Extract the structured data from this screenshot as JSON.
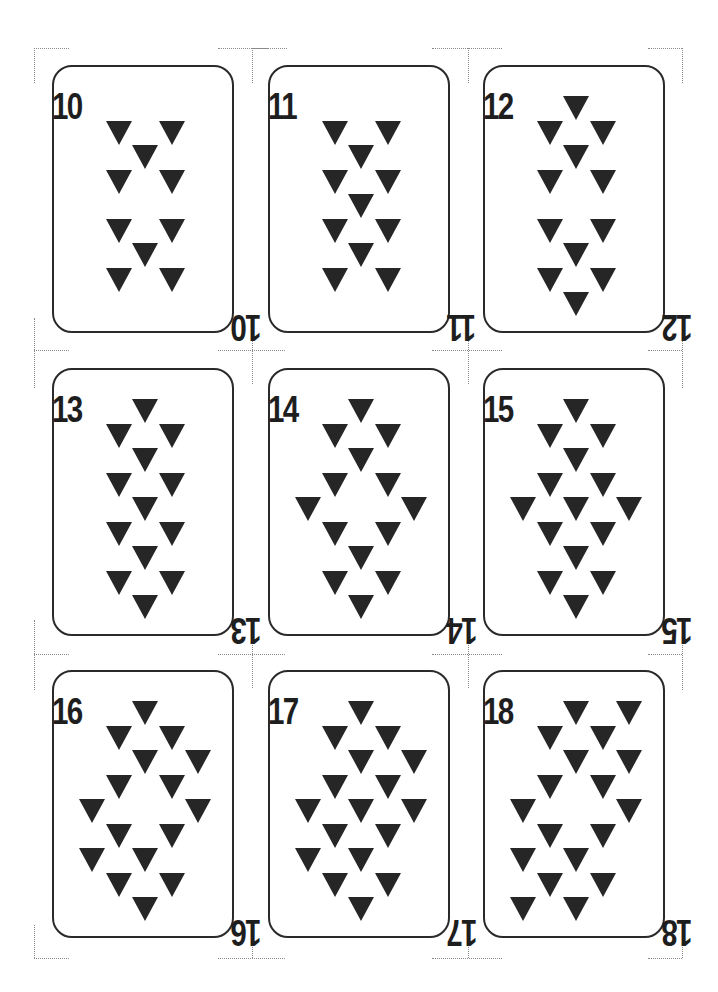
{
  "sheet": {
    "description": "Printable sheet of 9 playing cards (3x3) with inverted-triangle pips, ranks 10 through 18",
    "pip_shape": "inverted-triangle",
    "colors": {
      "ink": "#262626",
      "border": "#2a2a2a",
      "crop_marks": "#8a8a8a",
      "background": "#ffffff"
    }
  },
  "layout": {
    "columns_x": [
      52,
      268,
      483
    ],
    "rows_y": [
      65,
      368,
      670
    ],
    "pip_center_x": 91,
    "pip_step_x": 26.5,
    "pip_base_y": 41,
    "pip_step_y": 24.5
  },
  "cards": [
    {
      "rank": "10",
      "row": 0,
      "col": 0,
      "pips": [
        [
          -1,
          1
        ],
        [
          1,
          1
        ],
        [
          0,
          2
        ],
        [
          -1,
          3
        ],
        [
          1,
          3
        ],
        [
          -1,
          5
        ],
        [
          1,
          5
        ],
        [
          0,
          6
        ],
        [
          -1,
          7
        ],
        [
          1,
          7
        ]
      ]
    },
    {
      "rank": "11",
      "row": 0,
      "col": 1,
      "pips": [
        [
          -1,
          1
        ],
        [
          1,
          1
        ],
        [
          0,
          2
        ],
        [
          -1,
          3
        ],
        [
          1,
          3
        ],
        [
          0,
          4
        ],
        [
          -1,
          5
        ],
        [
          1,
          5
        ],
        [
          0,
          6
        ],
        [
          -1,
          7
        ],
        [
          1,
          7
        ]
      ]
    },
    {
      "rank": "12",
      "row": 0,
      "col": 2,
      "pips": [
        [
          0,
          0
        ],
        [
          -1,
          1
        ],
        [
          1,
          1
        ],
        [
          0,
          2
        ],
        [
          -1,
          3
        ],
        [
          1,
          3
        ],
        [
          -1,
          5
        ],
        [
          1,
          5
        ],
        [
          0,
          6
        ],
        [
          -1,
          7
        ],
        [
          1,
          7
        ],
        [
          0,
          8
        ]
      ]
    },
    {
      "rank": "13",
      "row": 1,
      "col": 0,
      "pips": [
        [
          0,
          0
        ],
        [
          -1,
          1
        ],
        [
          1,
          1
        ],
        [
          0,
          2
        ],
        [
          -1,
          3
        ],
        [
          1,
          3
        ],
        [
          0,
          4
        ],
        [
          -1,
          5
        ],
        [
          1,
          5
        ],
        [
          0,
          6
        ],
        [
          -1,
          7
        ],
        [
          1,
          7
        ],
        [
          0,
          8
        ]
      ]
    },
    {
      "rank": "14",
      "row": 1,
      "col": 1,
      "pips": [
        [
          0,
          0
        ],
        [
          -1,
          1
        ],
        [
          1,
          1
        ],
        [
          0,
          2
        ],
        [
          -1,
          3
        ],
        [
          1,
          3
        ],
        [
          -2,
          4
        ],
        [
          2,
          4
        ],
        [
          -1,
          5
        ],
        [
          1,
          5
        ],
        [
          0,
          6
        ],
        [
          -1,
          7
        ],
        [
          1,
          7
        ],
        [
          0,
          8
        ]
      ]
    },
    {
      "rank": "15",
      "row": 1,
      "col": 2,
      "pips": [
        [
          0,
          0
        ],
        [
          -1,
          1
        ],
        [
          1,
          1
        ],
        [
          0,
          2
        ],
        [
          -1,
          3
        ],
        [
          1,
          3
        ],
        [
          -2,
          4
        ],
        [
          0,
          4
        ],
        [
          2,
          4
        ],
        [
          -1,
          5
        ],
        [
          1,
          5
        ],
        [
          0,
          6
        ],
        [
          -1,
          7
        ],
        [
          1,
          7
        ],
        [
          0,
          8
        ]
      ]
    },
    {
      "rank": "16",
      "row": 2,
      "col": 0,
      "pips": [
        [
          0,
          0
        ],
        [
          -1,
          1
        ],
        [
          1,
          1
        ],
        [
          0,
          2
        ],
        [
          2,
          2
        ],
        [
          -1,
          3
        ],
        [
          1,
          3
        ],
        [
          -2,
          4
        ],
        [
          2,
          4
        ],
        [
          -1,
          5
        ],
        [
          1,
          5
        ],
        [
          -2,
          6
        ],
        [
          0,
          6
        ],
        [
          -1,
          7
        ],
        [
          1,
          7
        ],
        [
          0,
          8
        ]
      ]
    },
    {
      "rank": "17",
      "row": 2,
      "col": 1,
      "pips": [
        [
          0,
          0
        ],
        [
          -1,
          1
        ],
        [
          1,
          1
        ],
        [
          0,
          2
        ],
        [
          2,
          2
        ],
        [
          -1,
          3
        ],
        [
          1,
          3
        ],
        [
          -2,
          4
        ],
        [
          0,
          4
        ],
        [
          2,
          4
        ],
        [
          -1,
          5
        ],
        [
          1,
          5
        ],
        [
          -2,
          6
        ],
        [
          0,
          6
        ],
        [
          -1,
          7
        ],
        [
          1,
          7
        ],
        [
          0,
          8
        ]
      ]
    },
    {
      "rank": "18",
      "row": 2,
      "col": 2,
      "pips": [
        [
          0,
          0
        ],
        [
          2,
          0
        ],
        [
          -1,
          1
        ],
        [
          1,
          1
        ],
        [
          0,
          2
        ],
        [
          2,
          2
        ],
        [
          -1,
          3
        ],
        [
          1,
          3
        ],
        [
          -2,
          4
        ],
        [
          2,
          4
        ],
        [
          -1,
          5
        ],
        [
          1,
          5
        ],
        [
          -2,
          6
        ],
        [
          0,
          6
        ],
        [
          -1,
          7
        ],
        [
          1,
          7
        ],
        [
          -2,
          8
        ],
        [
          0,
          8
        ]
      ]
    }
  ],
  "crop_marks": {
    "horizontal": [
      [
        34,
        48,
        35
      ],
      [
        218,
        48,
        50
      ],
      [
        252,
        48,
        35
      ],
      [
        432,
        48,
        52
      ],
      [
        468,
        48,
        34
      ],
      [
        648,
        48,
        34
      ],
      [
        34,
        350,
        35
      ],
      [
        218,
        350,
        67
      ],
      [
        432,
        350,
        70
      ],
      [
        648,
        350,
        34
      ],
      [
        34,
        654,
        35
      ],
      [
        218,
        654,
        67
      ],
      [
        432,
        654,
        70
      ],
      [
        648,
        654,
        34
      ],
      [
        34,
        958,
        35
      ],
      [
        218,
        958,
        67
      ],
      [
        432,
        958,
        70
      ],
      [
        648,
        958,
        34
      ]
    ],
    "vertical": [
      [
        34,
        48,
        35
      ],
      [
        252,
        48,
        35
      ],
      [
        468,
        48,
        35
      ],
      [
        682,
        48,
        35
      ],
      [
        34,
        318,
        70
      ],
      [
        252,
        316,
        68
      ],
      [
        468,
        316,
        68
      ],
      [
        682,
        318,
        70
      ],
      [
        34,
        620,
        70
      ],
      [
        252,
        620,
        68
      ],
      [
        468,
        620,
        68
      ],
      [
        682,
        620,
        70
      ],
      [
        34,
        925,
        33
      ],
      [
        252,
        925,
        33
      ],
      [
        468,
        925,
        33
      ],
      [
        682,
        925,
        33
      ]
    ]
  }
}
